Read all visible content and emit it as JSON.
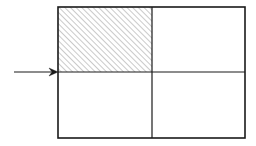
{
  "document": {
    "type": "technical-line-diagram",
    "title": "Rectangle divided into four quadrants with hatched upper-left quadrant and incoming arrow",
    "background_color": "#ffffff",
    "width": 256,
    "height": 146
  },
  "figure": {
    "name": "quadrant-diagram",
    "stroke_color": "#1a1a1a",
    "outline_width": 1.6,
    "divider_width": 1.2,
    "outer_rectangle": {
      "name": "outer-rectangle",
      "x": 58,
      "y": 7,
      "width": 187,
      "height": 131,
      "fill": "none"
    },
    "dividers": [
      {
        "name": "vertical-divider",
        "orientation": "vertical",
        "x": 152,
        "y1": 7,
        "y2": 138
      },
      {
        "name": "horizontal-divider",
        "orientation": "horizontal",
        "y": 72,
        "x1": 58,
        "x2": 245
      }
    ],
    "quadrants": [
      {
        "name": "quadrant-top-left",
        "position": "top-left",
        "x": 58,
        "y": 7,
        "width": 94,
        "height": 65,
        "fill": "hatch",
        "hatch": {
          "angle_degrees": 45,
          "direction": "lower-left-to-upper-right",
          "spacing": 4,
          "line_width": 0.9,
          "color": "#8a8a8a"
        }
      },
      {
        "name": "quadrant-top-right",
        "position": "top-right",
        "x": 152,
        "y": 7,
        "width": 93,
        "height": 65,
        "fill": "none"
      },
      {
        "name": "quadrant-bottom-left",
        "position": "bottom-left",
        "x": 58,
        "y": 72,
        "width": 94,
        "height": 66,
        "fill": "none"
      },
      {
        "name": "quadrant-bottom-right",
        "position": "bottom-right",
        "x": 152,
        "y": 72,
        "width": 93,
        "height": 66,
        "fill": "none"
      }
    ],
    "arrow": {
      "name": "incoming-arrow",
      "direction": "right",
      "shaft_x_start": 14,
      "shaft_x_end": 58,
      "y": 72,
      "shaft_width": 1.2,
      "head_length": 9,
      "head_half_height": 4,
      "color": "#1a1a1a"
    }
  },
  "labels": {
    "items": []
  }
}
